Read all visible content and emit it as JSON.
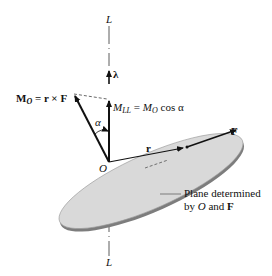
{
  "diagram": {
    "axis_label_top": "L",
    "axis_label_bottom": "L",
    "unit_vector_label": "λ",
    "moment_label": {
      "symbol": "M",
      "subscript": "O",
      "rest": " = r × F"
    },
    "projection_label": {
      "left_symbol": "M",
      "left_subscript": "LL",
      "equals": " = ",
      "right_symbol": "M",
      "right_subscript": "O",
      "rest": " cos α"
    },
    "angle_label": "α",
    "origin_label": "O",
    "position_vector_label": "r",
    "force_label": "F",
    "plane_caption_line1": "Plane determined",
    "plane_caption_line2_prefix": "by ",
    "plane_caption_line2_O": "O",
    "plane_caption_line2_mid": " and ",
    "plane_caption_line2_F": "F",
    "colors": {
      "plane_fill": "#d9d9d9",
      "plane_edge": "#8a8a8a",
      "ink": "#111111"
    }
  }
}
